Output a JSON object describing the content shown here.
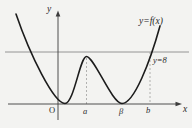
{
  "figure": {
    "labels": {
      "curve_label": "y=f(x)",
      "hline_label": "y=8",
      "x_axis_label": "x",
      "y_axis_label": "y",
      "origin_label": "O",
      "a_label": "a",
      "beta_label": "β",
      "b_label": "b"
    },
    "colors": {
      "background": "#f3f3f1",
      "curve": "#1c1c1c",
      "axis": "#3d3d3d",
      "reference_line": "#8a8a8a",
      "dashed_guide": "#9f9f9f"
    }
  },
  "chart_data": {
    "type": "line",
    "title": "",
    "xlabel": "x",
    "ylabel": "y",
    "grid": false,
    "x_axis_marks": [
      "O",
      "a",
      "β",
      "b"
    ],
    "series": [
      {
        "name": "y=f(x)",
        "description": "W-shaped curve: falls steeply from upper left, is tangent to the x-axis (y=0) at a point just right of the origin O, rises to a local maximum at x=a whose height is slightly below 8, falls to a second tangent minimum on the x-axis at x=β, then rises steeply through y=8 at x=b toward upper right",
        "key_points": [
          {
            "feature": "left minimum (touches x-axis)",
            "x": "near O (x slightly > 0)",
            "y": 0
          },
          {
            "feature": "local maximum",
            "x": "a",
            "y": "just below 8"
          },
          {
            "feature": "right minimum (touches x-axis)",
            "x": "β",
            "y": 0
          },
          {
            "feature": "crosses reference line rising",
            "x": "b",
            "y": 8
          }
        ]
      }
    ],
    "reference_lines": [
      {
        "label": "y=8",
        "orientation": "horizontal",
        "y": 8
      }
    ],
    "guides": [
      {
        "type": "vertical-dashed",
        "x": "a",
        "from": "x-axis",
        "to": "local maximum of curve"
      },
      {
        "type": "vertical-dashed",
        "x": "b",
        "from": "x-axis",
        "to": "intersection of curve with y=8"
      }
    ],
    "annotations": [
      "y=f(x)",
      "y=8"
    ]
  },
  "render": {
    "x_axis_path": "M8,104 H177",
    "x_axis_arrow_path": "M175.5,101.7 L182,104 L175.5,106.3 Z",
    "y_axis_path": "M58,120 V15",
    "y_axis_arrow_path": "M55.7,16.5 L58,10.5 L60.3,16.5 Z",
    "hline_path": "M5,52 H189",
    "dash_a_path": "M86.5,58 V104",
    "dash_b_path": "M150,52 V104",
    "curve_path": "M16,14 C30,55 54,103.5 65,103.5 C74,103.5 80,56.5 86.5,56.5 C94,56.5 112,103.5 122,103.5 C134,103.5 150,62 160,26"
  }
}
